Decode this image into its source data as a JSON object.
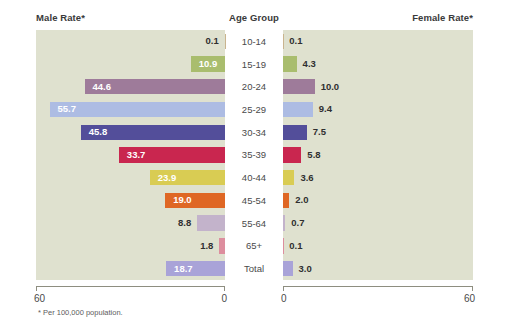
{
  "headers": {
    "male": "Male Rate*",
    "age_group": "Age Group",
    "female": "Female Rate*"
  },
  "footnote": "* Per 100,000 population.",
  "axis": {
    "left_min_label": "60",
    "left_max_label": "0",
    "right_min_label": "0",
    "right_max_label": "60"
  },
  "chart_data": {
    "type": "bar",
    "title": "",
    "subtitle": "",
    "orientation": "horizontal-diverging",
    "xlabel": "Rate per 100,000 population",
    "ylabel": "Age Group",
    "xlim": [
      0,
      60
    ],
    "grid": false,
    "legend": "none",
    "note": "* Per 100,000 population.",
    "categories": [
      "10-14",
      "15-19",
      "20-24",
      "25-29",
      "30-34",
      "35-39",
      "40-44",
      "45-54",
      "55-64",
      "65+",
      "Total"
    ],
    "series": [
      {
        "name": "Male Rate*",
        "side": "left",
        "values": [
          0.1,
          10.9,
          44.6,
          55.7,
          45.8,
          33.7,
          23.9,
          19.0,
          8.8,
          1.8,
          18.7
        ],
        "labels": [
          "0.1",
          "10.9",
          "44.6",
          "55.7",
          "45.8",
          "33.7",
          "23.9",
          "19.0",
          "8.8",
          "1.8",
          "18.7"
        ]
      },
      {
        "name": "Female Rate*",
        "side": "right",
        "values": [
          0.1,
          4.3,
          10.0,
          9.4,
          7.5,
          5.8,
          3.6,
          2.0,
          0.7,
          0.1,
          3.0
        ],
        "labels": [
          "0.1",
          "4.3",
          "10.0",
          "9.4",
          "7.5",
          "5.8",
          "3.6",
          "2.0",
          "0.7",
          "0.1",
          "3.0"
        ]
      }
    ],
    "colors": {
      "10-14": "#c9b48f",
      "15-19": "#a9bd6e",
      "20-24": "#9e7b9a",
      "25-29": "#adbce3",
      "30-34": "#534e9a",
      "35-39": "#c9264f",
      "40-44": "#d9cc53",
      "45-54": "#df6724",
      "55-64": "#c3b3cb",
      "65+": "#dd8e9e",
      "Total": "#a9a3d8"
    },
    "panel_background": "#dfe1cf",
    "label_inside_color": "#ffffff",
    "label_outside_color": "#2f2f2f"
  }
}
